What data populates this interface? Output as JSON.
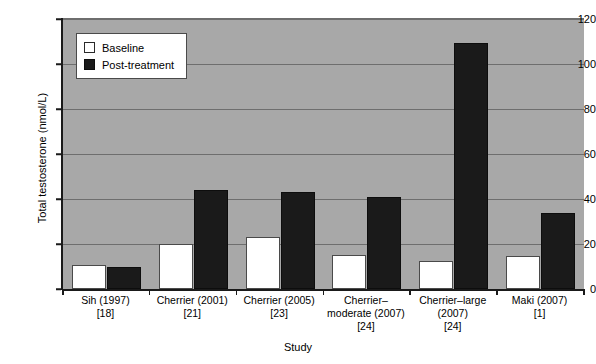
{
  "chart_data": {
    "type": "bar",
    "title": "",
    "xlabel": "Study",
    "ylabel": "Total testosterone (nmol/L)",
    "ylim": [
      0,
      120
    ],
    "ytick_values": [
      0,
      20,
      40,
      60,
      80,
      100,
      120
    ],
    "ytick_labels": [
      "0",
      "20",
      "40",
      "60",
      "80",
      "100",
      "120"
    ],
    "grid": true,
    "legend_position": "upper-left-inside",
    "categories": [
      "Sih (1997)\n[18]",
      "Cherrier (2001)\n[21]",
      "Cherrier (2005)\n[23]",
      "Cherrier–moderate (2007)\n[24]",
      "Cherrier–large (2007)\n[24]",
      "Maki (2007)\n[1]"
    ],
    "category_lines": [
      [
        "Sih (1997)",
        "[18]"
      ],
      [
        "Cherrier (2001)",
        "[21]"
      ],
      [
        "Cherrier (2005)",
        "[23]"
      ],
      [
        "Cherrier–",
        "moderate (2007)",
        "[24]"
      ],
      [
        "Cherrier–large",
        "(2007)",
        "[24]"
      ],
      [
        "Maki (2007)",
        "[1]"
      ]
    ],
    "series": [
      {
        "name": "Baseline",
        "color": "#ffffff",
        "values": [
          10.5,
          20,
          23,
          15,
          12.5,
          14.5
        ]
      },
      {
        "name": "Post-treatment",
        "color": "#1a1a1a",
        "values": [
          10,
          44,
          43,
          41,
          109.5,
          34
        ]
      }
    ]
  },
  "legend": {
    "items": [
      {
        "label": "Baseline",
        "swatch": "white-square"
      },
      {
        "label": "Post-treatment",
        "swatch": "black-square"
      }
    ]
  },
  "colors": {
    "plot_background": "#a8a8a8",
    "gridline": "#6e6e6e",
    "axis": "#1a1a1a",
    "baseline_series": "#ffffff",
    "post_series": "#1a1a1a",
    "page_background": "#ffffff"
  }
}
